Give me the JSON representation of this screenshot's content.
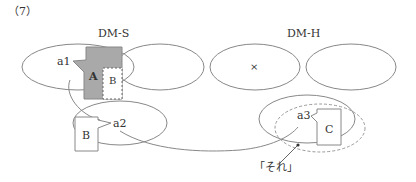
{
  "problem_number": "（7）",
  "panels": {
    "left_title": "DM-S",
    "right_title": "DM-H"
  },
  "labels": {
    "a1": "a1",
    "a2": "a2",
    "a3": "a3",
    "box_A": "A",
    "box_B_top": "B",
    "box_B_bottom": "B",
    "box_C": "C",
    "cross": "×",
    "sore": "「それ」"
  },
  "colors": {
    "shaded_box": "#a9a9a9",
    "stroke": "#888888",
    "dashed": "#999999"
  }
}
